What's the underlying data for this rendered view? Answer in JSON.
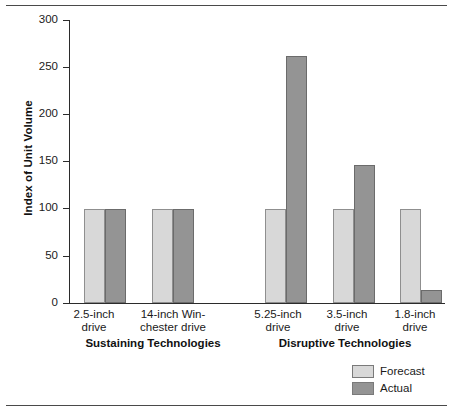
{
  "chart_data": {
    "type": "bar",
    "title": "",
    "xlabel": "",
    "ylabel": "Index of Unit Volume",
    "ylim": [
      0,
      300
    ],
    "yticks": [
      0,
      50,
      100,
      150,
      200,
      250,
      300
    ],
    "grid": false,
    "legend_position": "bottom-right",
    "categories": [
      "2.5-inch drive",
      "14-inch Win-chester drive",
      "5.25-inch drive",
      "3.5-inch drive",
      "1.8-inch drive"
    ],
    "series": [
      {
        "name": "Forecast",
        "color": "#d8d8d8",
        "values": [
          100,
          100,
          100,
          100,
          100
        ]
      },
      {
        "name": "Actual",
        "color": "#949494",
        "values": [
          100,
          100,
          262,
          146,
          14
        ]
      }
    ],
    "groups": [
      {
        "label": "Sustaining Technologies",
        "categories": [
          "2.5-inch drive",
          "14-inch Win-chester drive"
        ]
      },
      {
        "label": "Disruptive Technologies",
        "categories": [
          "5.25-inch drive",
          "3.5-inch drive",
          "1.8-inch drive"
        ]
      }
    ]
  },
  "axis": {
    "y_title": "Index of Unit Volume",
    "ticks": {
      "t300": "300",
      "t250": "250",
      "t200": "200",
      "t150": "150",
      "t100": "100",
      "t50": "50",
      "t0": "0"
    }
  },
  "categories": {
    "c0_line1": "2.5-inch",
    "c0_line2": "drive",
    "c1_line1": "14-inch Win-",
    "c1_line2": "chester drive",
    "c2_line1": "5.25-inch",
    "c2_line2": "drive",
    "c3_line1": "3.5-inch",
    "c3_line2": "drive",
    "c4_line1": "1.8-inch",
    "c4_line2": "drive"
  },
  "groups": {
    "sustaining": "Sustaining Technologies",
    "disruptive": "Disruptive Technologies"
  },
  "legend": {
    "forecast": "Forecast",
    "actual": "Actual"
  },
  "colors": {
    "forecast": "#d8d8d8",
    "actual": "#949494",
    "axis": "#2b2b2b",
    "rule": "#4a4a4a"
  }
}
